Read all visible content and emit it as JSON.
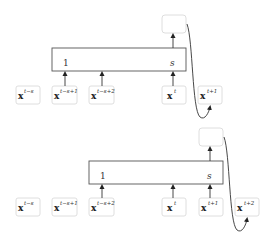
{
  "diagrams": [
    {
      "name": "step-t",
      "window_start_label": "1",
      "window_end_label": "s",
      "inputs": [
        {
          "base": "x",
          "sup": "t−s"
        },
        {
          "base": "x",
          "sup": "t−s+1"
        },
        {
          "base": "x",
          "sup": "t−s+2"
        },
        {
          "base": "x",
          "sup": "t"
        },
        {
          "base": "x",
          "sup": "t+1"
        }
      ],
      "output_label": "",
      "target": "x^{t+1}"
    },
    {
      "name": "step-t-plus-1",
      "window_start_label": "1",
      "window_end_label": "s",
      "inputs": [
        {
          "base": "x",
          "sup": "t−s"
        },
        {
          "base": "x",
          "sup": "t−s+1"
        },
        {
          "base": "x",
          "sup": "t−s+2"
        },
        {
          "base": "x",
          "sup": "t"
        },
        {
          "base": "x",
          "sup": "t+1"
        },
        {
          "base": "x",
          "sup": "t+2"
        }
      ],
      "output_label": "",
      "target": "x^{t+2}"
    }
  ]
}
